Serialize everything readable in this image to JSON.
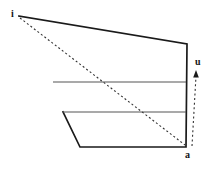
{
  "figure": {
    "background_color": "#ffffff",
    "stroke_color": "#1a1a1a",
    "thin_stroke_color": "#555555",
    "width": 216,
    "height": 170,
    "labels": {
      "apex": "i",
      "bottom_right": "a",
      "arrow": "u"
    },
    "outline": {
      "name": "quadrilateral-outline",
      "points": "19,16 187,44 186,147 80,147 63,112",
      "stroke_width": 1.7
    },
    "horizontal_lines": [
      {
        "name": "upper-horizontal-line",
        "x1": 53,
        "y1": 82,
        "x2": 186,
        "y2": 82
      },
      {
        "name": "lower-horizontal-line",
        "x1": 63,
        "y1": 112,
        "x2": 186,
        "y2": 112
      }
    ],
    "dashed_diagonal": {
      "name": "dashed-diagonal",
      "x1": 20,
      "y1": 18,
      "x2": 185,
      "y2": 145,
      "dash": "2,2.4"
    },
    "dashed_arrow": {
      "name": "dashed-arrow-u",
      "x1": 192,
      "y1": 146,
      "x2": 196,
      "y2": 74,
      "dash": "2,2.6",
      "head_points": "196,70 193.2,77.5 198.8,77.5"
    }
  }
}
